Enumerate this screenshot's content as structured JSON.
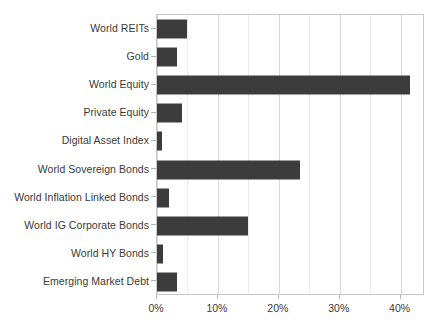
{
  "chart_data": {
    "type": "bar",
    "orientation": "horizontal",
    "title": "",
    "xlabel": "",
    "ylabel": "",
    "xlim": [
      0,
      44
    ],
    "xticks": [
      0,
      10,
      20,
      30,
      40
    ],
    "xtick_labels": [
      "0%",
      "10%",
      "20%",
      "30%",
      "40%"
    ],
    "grid": "vertical-minor-and-major",
    "legend": "none",
    "bar_color": "#3c3c3c",
    "categories": [
      "World REITs",
      "Gold",
      "World Equity",
      "Private Equity",
      "Digital Asset Index",
      "World Sovereign Bonds",
      "World Inflation Linked Bonds",
      "World IG Corporate Bonds",
      "World HY Bonds",
      "Emerging Market Debt"
    ],
    "values": [
      5.0,
      3.3,
      41.5,
      4.1,
      0.8,
      23.5,
      2.0,
      15.0,
      1.0,
      3.3
    ],
    "value_labels": [
      "5.0%",
      "3.3%",
      "41.5%",
      "4.1%",
      "0.8%",
      "23.5%",
      "2.0%",
      "15.0%",
      "1.0%",
      "3.3%"
    ]
  },
  "axis": {
    "minor_gridline_step": 5,
    "major_gridline_step": 10
  }
}
